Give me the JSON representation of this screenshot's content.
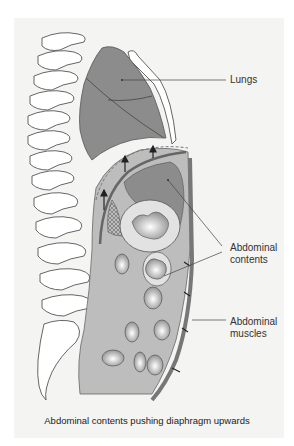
{
  "diagram": {
    "labels": {
      "lungs": "Lungs",
      "abdominal_contents": "Abdominal\ncontents",
      "abdominal_muscles": "Abdominal\nmuscles"
    },
    "caption": "Abdominal contents pushing diaphragm upwards",
    "colors": {
      "background_panel": "#f4f4f2",
      "organ_fill": "#8c8c8c",
      "cavity_fill": "#bdbdbd",
      "light_fill": "#e2e2e2",
      "outline": "#555555",
      "bone_fill": "#ffffff"
    }
  }
}
